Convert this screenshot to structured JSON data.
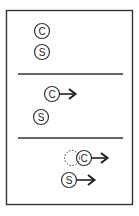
{
  "diagram": {
    "stroke_color": "#333333",
    "background": "#ffffff",
    "panels": [
      {
        "id": "panel-1",
        "nodes": [
          {
            "label": "C",
            "x": 42,
            "y": 31,
            "arrow": false,
            "ghost": false
          },
          {
            "label": "S",
            "x": 42,
            "y": 52,
            "arrow": false,
            "ghost": false
          }
        ]
      },
      {
        "id": "panel-2",
        "nodes": [
          {
            "label": "C",
            "x": 52,
            "y": 94,
            "arrow": true,
            "ghost": false
          },
          {
            "label": "S",
            "x": 41,
            "y": 117,
            "arrow": false,
            "ghost": false
          }
        ]
      },
      {
        "id": "panel-3",
        "nodes": [
          {
            "label": "",
            "x": 72,
            "y": 158,
            "arrow": false,
            "ghost": true
          },
          {
            "label": "C",
            "x": 84,
            "y": 158,
            "arrow": true,
            "ghost": false
          },
          {
            "label": "S",
            "x": 69,
            "y": 180,
            "arrow": true,
            "ghost": false
          }
        ]
      }
    ]
  }
}
